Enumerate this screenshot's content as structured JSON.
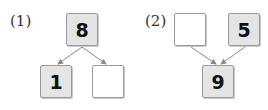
{
  "problems": [
    {
      "label": "(1)",
      "top": {
        "value": "8"
      },
      "bottom_left": {
        "value": "1"
      },
      "bottom_right": {
        "value": ""
      }
    },
    {
      "label": "(2)",
      "top_left": {
        "value": ""
      },
      "top_right": {
        "value": "5"
      },
      "bottom": {
        "value": "9"
      }
    }
  ],
  "colors": {
    "filled_box": "#e4e4e4",
    "empty_box": "#ffffff",
    "border": "#9a9a9a",
    "arrow": "#8a8a8a"
  }
}
